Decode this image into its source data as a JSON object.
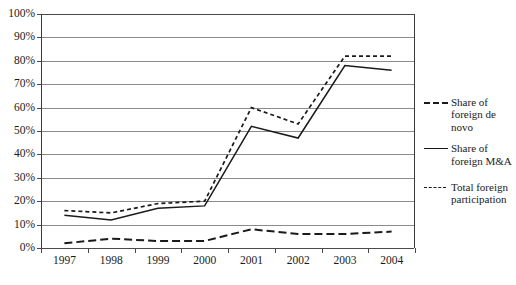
{
  "chart_data": {
    "type": "line",
    "title": "",
    "xlabel": "",
    "ylabel": "",
    "categories": [
      "1997",
      "1998",
      "1999",
      "2000",
      "2001",
      "2002",
      "2003",
      "2004"
    ],
    "ylim": [
      0,
      100
    ],
    "ytick_labels": [
      "0%",
      "10%",
      "20%",
      "30%",
      "40%",
      "50%",
      "60%",
      "70%",
      "80%",
      "90%",
      "100%"
    ],
    "ytick_values": [
      0,
      10,
      20,
      30,
      40,
      50,
      60,
      70,
      80,
      90,
      100
    ],
    "grid": true,
    "legend_position": "right",
    "series": [
      {
        "name": "Share of foreign de novo",
        "style": "long-dash",
        "values": [
          2,
          4,
          3,
          3,
          8,
          6,
          6,
          7
        ]
      },
      {
        "name": "Share of foreign M&A",
        "style": "solid",
        "values": [
          14,
          12,
          17,
          18,
          52,
          47,
          78,
          76
        ]
      },
      {
        "name": "Total foreign participation",
        "style": "short-dash",
        "values": [
          16,
          15,
          19,
          20,
          60,
          53,
          82,
          82
        ]
      }
    ]
  },
  "legend": {
    "items": [
      {
        "label": "Share of foreign de novo",
        "style": "long-dash"
      },
      {
        "label": "Share of foreign M&A",
        "style": "solid"
      },
      {
        "label": "Total foreign participation",
        "style": "short-dash"
      }
    ]
  },
  "colors": {
    "line": "#1a1a1a",
    "grid": "#8b8b8b",
    "axis": "#4a4a4a",
    "background": "#ffffff"
  }
}
